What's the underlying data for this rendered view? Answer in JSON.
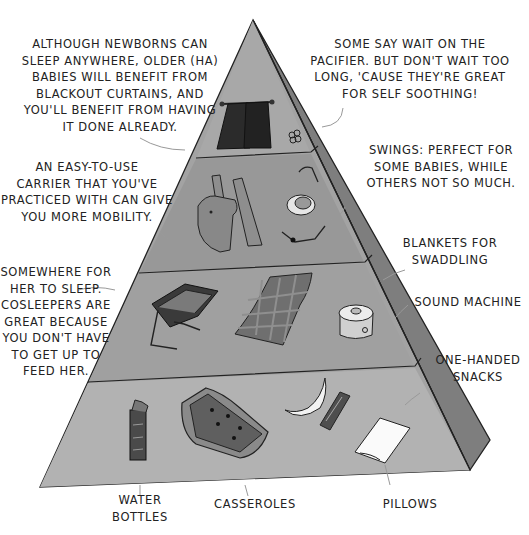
{
  "illustration": {
    "title": "Baby essentials pyramid",
    "colors": {
      "background": "#ffffff",
      "pyramid_front": "#9e9e9e",
      "pyramid_side": "#7d7d7d",
      "outline": "#222222",
      "curtain": "#2a2a2a"
    },
    "tiers": [
      {
        "level": 1,
        "position": "top",
        "items": [
          "blackout-curtains",
          "pacifier"
        ]
      },
      {
        "level": 2,
        "position": "upper-middle",
        "items": [
          "baby-carrier",
          "baby-swing"
        ]
      },
      {
        "level": 3,
        "position": "lower-middle",
        "items": [
          "co-sleeper",
          "swaddling-blanket",
          "sound-machine"
        ]
      },
      {
        "level": 4,
        "position": "base",
        "items": [
          "water-bottle",
          "casserole",
          "banana",
          "snack-bar",
          "pillow"
        ]
      }
    ]
  },
  "annotations": {
    "blackout_curtains": "ALTHOUGH NEWBORNS CAN\nSLEEP ANYWHERE, OLDER (HA)\nBABIES WILL BENEFIT FROM\nBLACKOUT CURTAINS, AND\nYOU'LL BENEFIT FROM HAVING\nIT DONE ALREADY.",
    "pacifier": "SOME SAY WAIT ON THE\nPACIFIER. BUT DON'T WAIT TOO\nLONG, 'CAUSE THEY'RE GREAT\nFOR SELF SOOTHING!",
    "carrier": "AN EASY-TO-USE\nCARRIER THAT YOU'VE\nPRACTICED WITH CAN GIVE\nYOU MORE MOBILITY.",
    "swings": "SWINGS: PERFECT FOR\nSOME BABIES, WHILE\nOTHERS NOT SO MUCH.",
    "blankets": "BLANKETS FOR\nSWADDLING",
    "sound_machine": "SOUND MACHINE",
    "cosleeper": "SOMEWHERE FOR\nHER TO SLEEP.\nCOSLEEPERS ARE\nGREAT BECAUSE\nYOU DON'T HAVE\nTO GET UP TO\nFEED HER.",
    "snacks": "ONE-HANDED\nSNACKS",
    "water_bottles": "WATER\nBOTTLES",
    "casseroles": "CASSEROLES",
    "pillows": "PILLOWS"
  }
}
